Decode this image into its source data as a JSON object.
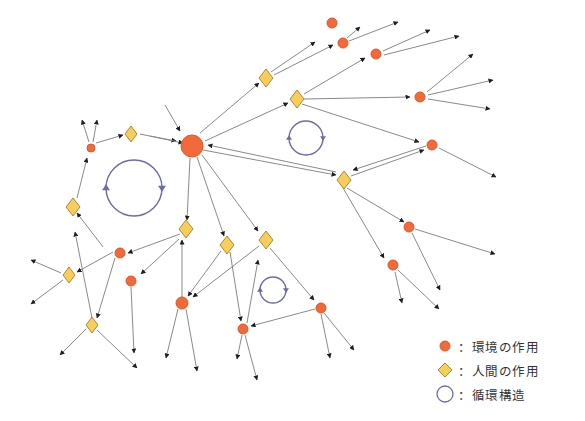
{
  "colors": {
    "environment_node": "#F26A3A",
    "environment_stroke": "#E0572A",
    "human_node": "#F8CD5A",
    "human_stroke": "#A88A3A",
    "edge": "#8A8A8A",
    "arrowhead": "#1E1E1E",
    "cycle": "#6C6CA8"
  },
  "legend": {
    "items": [
      {
        "icon": "orange-circle",
        "label": "：環境の作用"
      },
      {
        "icon": "yellow-diamond",
        "label": "：人間の作用"
      },
      {
        "icon": "blue-ring",
        "label": "：循環構造"
      }
    ]
  },
  "nodes": [
    {
      "id": "hub",
      "type": "environment",
      "x": 192,
      "y": 146,
      "r": 11
    },
    {
      "id": "e_top1",
      "type": "environment",
      "x": 332,
      "y": 23,
      "r": 5
    },
    {
      "id": "e_top2",
      "type": "environment",
      "x": 343,
      "y": 43,
      "r": 5
    },
    {
      "id": "e_top3",
      "type": "environment",
      "x": 376,
      "y": 54,
      "r": 5
    },
    {
      "id": "e_right1",
      "type": "environment",
      "x": 420,
      "y": 97,
      "r": 5
    },
    {
      "id": "e_right2",
      "type": "environment",
      "x": 432,
      "y": 145,
      "r": 5
    },
    {
      "id": "e_left_top",
      "type": "environment",
      "x": 91,
      "y": 148,
      "r": 4
    },
    {
      "id": "e_r3",
      "type": "environment",
      "x": 409,
      "y": 227,
      "r": 5
    },
    {
      "id": "e_r4",
      "type": "environment",
      "x": 393,
      "y": 265,
      "r": 5
    },
    {
      "id": "e_l1",
      "type": "environment",
      "x": 120,
      "y": 253,
      "r": 5
    },
    {
      "id": "e_l2",
      "type": "environment",
      "x": 131,
      "y": 281,
      "r": 5
    },
    {
      "id": "e_mid_low",
      "type": "environment",
      "x": 182,
      "y": 303,
      "r": 6
    },
    {
      "id": "e_low2",
      "type": "environment",
      "x": 243,
      "y": 329,
      "r": 5
    },
    {
      "id": "e_low3",
      "type": "environment",
      "x": 321,
      "y": 308,
      "r": 5
    },
    {
      "id": "h_top1",
      "type": "human",
      "x": 266,
      "y": 78,
      "s": 7
    },
    {
      "id": "h_top2",
      "type": "human",
      "x": 297,
      "y": 99,
      "s": 7
    },
    {
      "id": "h_left_top",
      "type": "human",
      "x": 131,
      "y": 134,
      "s": 6
    },
    {
      "id": "h_right",
      "type": "human",
      "x": 344,
      "y": 180,
      "s": 7
    },
    {
      "id": "h_left",
      "type": "human",
      "x": 73,
      "y": 207,
      "s": 7
    },
    {
      "id": "h_mid1",
      "type": "human",
      "x": 186,
      "y": 229,
      "s": 7
    },
    {
      "id": "h_mid2",
      "type": "human",
      "x": 227,
      "y": 245,
      "s": 7
    },
    {
      "id": "h_mid3",
      "type": "human",
      "x": 266,
      "y": 240,
      "s": 7
    },
    {
      "id": "h_l2",
      "type": "human",
      "x": 69,
      "y": 275,
      "s": 6
    },
    {
      "id": "h_l3",
      "type": "human",
      "x": 92,
      "y": 325,
      "s": 6
    }
  ],
  "edges": [
    [
      165,
      105,
      180,
      131
    ],
    [
      150,
      136,
      176,
      141
    ],
    [
      200,
      133,
      259,
      83
    ],
    [
      205,
      141,
      288,
      103
    ],
    [
      203,
      150,
      336,
      175
    ],
    [
      336,
      172,
      208,
      145
    ],
    [
      271,
      72,
      315,
      42
    ],
    [
      274,
      75,
      333,
      45
    ],
    [
      347,
      38,
      360,
      27
    ],
    [
      349,
      41,
      398,
      22
    ],
    [
      304,
      94,
      365,
      58
    ],
    [
      304,
      99,
      410,
      97
    ],
    [
      302,
      104,
      419,
      142
    ],
    [
      383,
      51,
      430,
      30
    ],
    [
      384,
      55,
      459,
      36
    ],
    [
      427,
      92,
      473,
      54
    ],
    [
      428,
      95,
      493,
      80
    ],
    [
      428,
      99,
      490,
      109
    ],
    [
      439,
      148,
      496,
      177
    ],
    [
      351,
      176,
      424,
      150
    ],
    [
      426,
      146,
      353,
      170
    ],
    [
      347,
      188,
      404,
      222
    ],
    [
      343,
      188,
      384,
      258
    ],
    [
      415,
      229,
      495,
      254
    ],
    [
      412,
      233,
      440,
      290
    ],
    [
      395,
      272,
      402,
      303
    ],
    [
      398,
      270,
      439,
      309
    ],
    [
      140,
      134,
      183,
      143
    ],
    [
      96,
      143,
      123,
      135
    ],
    [
      89,
      142,
      82,
      120
    ],
    [
      93,
      142,
      97,
      120
    ],
    [
      77,
      198,
      87,
      158
    ],
    [
      103,
      247,
      77,
      213
    ],
    [
      190,
      158,
      187,
      220
    ],
    [
      197,
      157,
      224,
      236
    ],
    [
      202,
      155,
      258,
      231
    ],
    [
      270,
      248,
      314,
      300
    ],
    [
      180,
      234,
      128,
      253
    ],
    [
      179,
      239,
      141,
      274
    ],
    [
      113,
      252,
      77,
      272
    ],
    [
      115,
      258,
      97,
      318
    ],
    [
      61,
      273,
      31,
      260
    ],
    [
      63,
      280,
      31,
      304
    ],
    [
      86,
      329,
      60,
      355
    ],
    [
      97,
      330,
      137,
      368
    ],
    [
      92,
      318,
      75,
      232
    ],
    [
      131,
      287,
      134,
      353
    ],
    [
      182,
      297,
      182,
      240
    ],
    [
      221,
      251,
      188,
      296
    ],
    [
      259,
      246,
      193,
      297
    ],
    [
      230,
      252,
      241,
      321
    ],
    [
      247,
      323,
      258,
      260
    ],
    [
      315,
      309,
      251,
      326
    ],
    [
      178,
      309,
      166,
      358
    ],
    [
      186,
      309,
      197,
      371
    ],
    [
      242,
      335,
      237,
      359
    ],
    [
      245,
      335,
      257,
      380
    ],
    [
      321,
      314,
      330,
      358
    ],
    [
      324,
      313,
      354,
      350
    ]
  ],
  "cycles": [
    {
      "id": "cycle-large",
      "cx": 134,
      "cy": 188,
      "r": 28
    },
    {
      "id": "cycle-right",
      "cx": 306,
      "cy": 138,
      "r": 17
    },
    {
      "id": "cycle-small",
      "cx": 273,
      "cy": 290,
      "r": 13
    }
  ]
}
